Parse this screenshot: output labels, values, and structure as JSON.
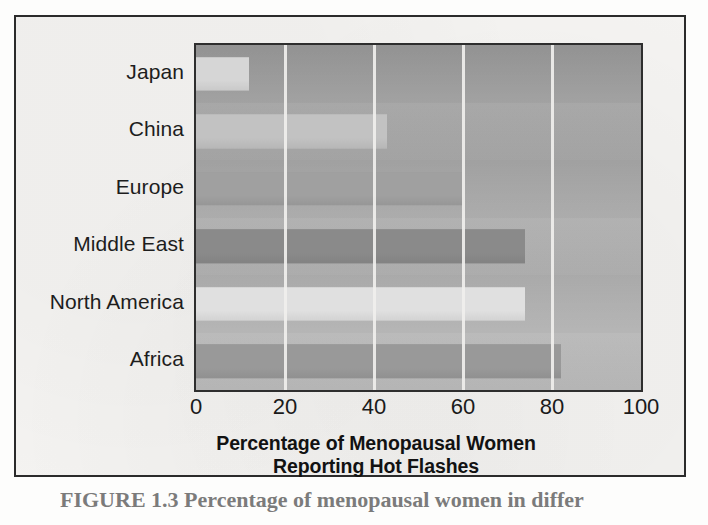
{
  "figure": {
    "caption": "FIGURE 1.3  Percentage of menopausal women in differ"
  },
  "chart_data": {
    "type": "bar",
    "orientation": "horizontal",
    "title": "",
    "xlabel": "Percentage of Menopausal Women Reporting Hot Flashes",
    "xlabel_lines": [
      "Percentage of Menopausal Women",
      "Reporting Hot Flashes"
    ],
    "ylabel": "",
    "categories": [
      "Japan",
      "China",
      "Europe",
      "Middle East",
      "North America",
      "Africa"
    ],
    "values": [
      12,
      43,
      60,
      74,
      74,
      82
    ],
    "xlim": [
      0,
      100
    ],
    "xticks": [
      0,
      20,
      40,
      60,
      80,
      100
    ],
    "xtick_labels": [
      "0",
      "20",
      "40",
      "60",
      "80",
      "100"
    ],
    "grid": true,
    "gridline_color": "#f0efed",
    "legend": null,
    "bar_colors": [
      "#d6d6d6",
      "#c2c2c2",
      "#a0a0a0",
      "#8a8a8a",
      "#e0e0e0",
      "#999999"
    ],
    "plot_background": "#adadad",
    "frame_color": "#2e2e2e"
  },
  "colors": {
    "paper": "#f4f3f1",
    "ink": "#1d1d1d",
    "frame": "#2b2b2b"
  }
}
